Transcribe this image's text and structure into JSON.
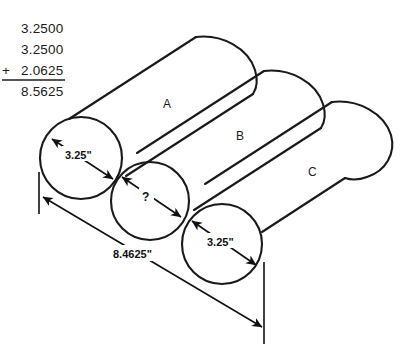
{
  "calculation": {
    "name": "column-addition",
    "operand1": "3.2500",
    "operand2": "3.2500",
    "operator": "+",
    "operand3": "2.0625",
    "sum": "8.5625"
  },
  "diagram": {
    "cylinders": [
      {
        "id": "A",
        "label": "A"
      },
      {
        "id": "B",
        "label": "B"
      },
      {
        "id": "C",
        "label": "C"
      }
    ],
    "dimensions": [
      {
        "name": "diameter-a",
        "value": "3.25\"",
        "target": "A"
      },
      {
        "name": "gap-b-unknown",
        "value": "?",
        "target": "B"
      },
      {
        "name": "diameter-c",
        "value": "3.25\"",
        "target": "C"
      },
      {
        "name": "overall-span",
        "value": "8.4625\"",
        "target": "overall"
      }
    ]
  },
  "colors": {
    "ink": "#1a1a1a",
    "dimension": "#111111",
    "background": "#ffffff"
  }
}
